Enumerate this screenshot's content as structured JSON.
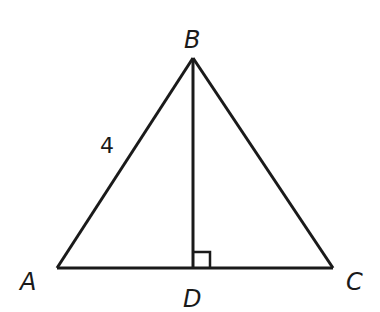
{
  "figure": {
    "stroke_color": "#1a1a1a",
    "background": "#ffffff",
    "points": {
      "A": {
        "label": "A",
        "x": 57,
        "y": 268
      },
      "B": {
        "label": "B",
        "x": 193,
        "y": 58
      },
      "C": {
        "label": "C",
        "x": 333,
        "y": 268
      },
      "D": {
        "label": "D",
        "x": 193,
        "y": 268
      }
    },
    "segments": [
      {
        "from": "A",
        "to": "B"
      },
      {
        "from": "B",
        "to": "C"
      },
      {
        "from": "A",
        "to": "C"
      },
      {
        "from": "B",
        "to": "D"
      }
    ],
    "side_label": {
      "segment": "AB",
      "text": "4"
    },
    "right_angle_marker": {
      "at": "D",
      "between": [
        "B",
        "C"
      ]
    }
  }
}
